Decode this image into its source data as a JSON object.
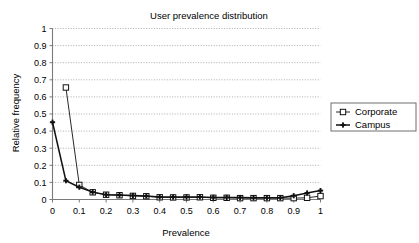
{
  "chart_data": {
    "type": "line",
    "title": "User prevalence distribution",
    "xlabel": "Prevalence",
    "ylabel": "Relative frequency",
    "xlim": [
      0,
      1
    ],
    "ylim": [
      0,
      1
    ],
    "x_ticks": [
      "0",
      "0.1",
      "0.2",
      "0.3",
      "0.4",
      "0.5",
      "0.6",
      "0.7",
      "0.8",
      "0.9",
      "1"
    ],
    "x_tick_values": [
      0,
      0.1,
      0.2,
      0.3,
      0.4,
      0.5,
      0.6,
      0.7,
      0.8,
      0.9,
      1
    ],
    "y_ticks": [
      "0",
      "0.1",
      "0.2",
      "0.3",
      "0.4",
      "0.5",
      "0.6",
      "0.7",
      "0.8",
      "0.9",
      "1"
    ],
    "y_tick_values": [
      0,
      0.1,
      0.2,
      0.3,
      0.4,
      0.5,
      0.6,
      0.7,
      0.8,
      0.9,
      1
    ],
    "grid": "horizontal",
    "legend_position": "right",
    "x": [
      0,
      0.05,
      0.1,
      0.15,
      0.2,
      0.25,
      0.3,
      0.35,
      0.4,
      0.45,
      0.5,
      0.55,
      0.6,
      0.65,
      0.7,
      0.75,
      0.8,
      0.85,
      0.9,
      0.95,
      1
    ],
    "series": [
      {
        "name": "Corporate",
        "marker": "open-square",
        "color": "#111111",
        "values": [
          null,
          0.655,
          0.085,
          0.042,
          0.028,
          0.025,
          0.021,
          0.019,
          0.013,
          0.012,
          0.012,
          0.013,
          0.01,
          0.01,
          0.008,
          0.008,
          0.008,
          0.008,
          0.008,
          0.01,
          0.02
        ]
      },
      {
        "name": "Campus",
        "marker": "filled-plus",
        "color": "#111111",
        "values": [
          0.452,
          0.11,
          0.072,
          0.043,
          0.028,
          0.026,
          0.023,
          0.02,
          0.015,
          0.014,
          0.014,
          0.015,
          0.012,
          0.012,
          0.011,
          0.01,
          0.01,
          0.01,
          0.022,
          0.038,
          0.052
        ]
      }
    ]
  },
  "legend": {
    "entries": [
      {
        "label": "Corporate"
      },
      {
        "label": "Campus"
      }
    ]
  }
}
